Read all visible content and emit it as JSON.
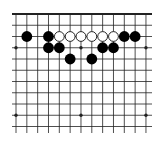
{
  "diagram": {
    "type": "go-board-fragment",
    "edge": "top",
    "columns": 13,
    "rows": 11,
    "colors": {
      "background": "#ffffff",
      "line": "#222222",
      "black_stone": "#000000",
      "white_stone_fill": "#ffffff",
      "white_stone_outline": "#111111"
    },
    "star_points": [
      [
        0,
        3
      ],
      [
        6,
        3
      ],
      [
        12,
        3
      ],
      [
        0,
        9
      ],
      [
        6,
        9
      ],
      [
        12,
        9
      ]
    ],
    "stones": [
      {
        "color": "black",
        "col": 1,
        "row": 2
      },
      {
        "color": "black",
        "col": 3,
        "row": 2
      },
      {
        "color": "white",
        "col": 4,
        "row": 2
      },
      {
        "color": "white",
        "col": 5,
        "row": 2
      },
      {
        "color": "white",
        "col": 6,
        "row": 2
      },
      {
        "color": "white",
        "col": 7,
        "row": 2
      },
      {
        "color": "white",
        "col": 8,
        "row": 2
      },
      {
        "color": "white",
        "col": 9,
        "row": 2
      },
      {
        "color": "black",
        "col": 10,
        "row": 2
      },
      {
        "color": "black",
        "col": 11,
        "row": 2
      },
      {
        "color": "black",
        "col": 3,
        "row": 3
      },
      {
        "color": "black",
        "col": 4,
        "row": 3
      },
      {
        "color": "black",
        "col": 8,
        "row": 3
      },
      {
        "color": "black",
        "col": 9,
        "row": 3
      },
      {
        "color": "black",
        "col": 5,
        "row": 4
      },
      {
        "color": "black",
        "col": 7,
        "row": 4
      }
    ]
  }
}
